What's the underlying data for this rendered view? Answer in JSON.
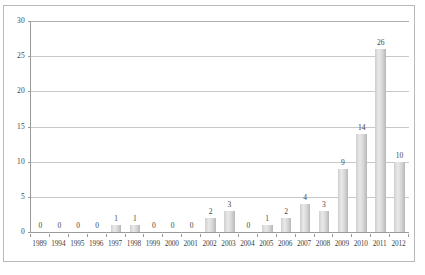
{
  "chart_data": {
    "type": "bar",
    "title": "",
    "xlabel": "",
    "ylabel": "",
    "ylim": [
      0,
      30
    ],
    "yticks": [
      0,
      5,
      10,
      15,
      20,
      25,
      30
    ],
    "ytick_labels": [
      "0",
      "5",
      "10",
      "15",
      "20",
      "25",
      "30"
    ],
    "grid": true,
    "legend": "none",
    "categories": [
      "1989",
      "1994",
      "1995",
      "1996",
      "1997",
      "1998",
      "1999",
      "2000",
      "2001",
      "2002",
      "2003",
      "2004",
      "2005",
      "2006",
      "2007",
      "2008",
      "2009",
      "2010",
      "2011",
      "2012"
    ],
    "values": [
      0,
      0,
      0,
      0,
      1,
      1,
      0,
      0,
      0,
      2,
      3,
      0,
      1,
      2,
      4,
      3,
      9,
      14,
      26,
      10
    ],
    "data_labels": [
      "0",
      "0",
      "0",
      "0",
      "1",
      "1",
      "0",
      "0",
      "0",
      "2",
      "3",
      "0",
      "1",
      "2",
      "4",
      "3",
      "9",
      "14",
      "26",
      "10"
    ],
    "bar_color": "#d4d4d4",
    "grid_color": "#c8c8c8",
    "axis_color": "#9a9a9a",
    "frame_color": "#b9b9b9",
    "text_color": "#3f3f3f"
  }
}
